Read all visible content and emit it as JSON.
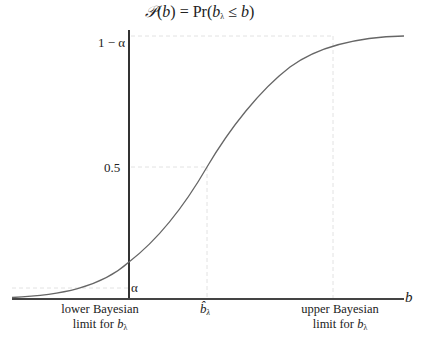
{
  "diagram": {
    "title_parts": {
      "func": "𝒫",
      "lhs_arg": "b",
      "eq": "=",
      "pr": "Pr",
      "var": "b",
      "var_sub": "λ",
      "rel": "≤",
      "rhs": "b"
    },
    "y_ticks": [
      {
        "label": "1 − α",
        "value": "1-alpha"
      },
      {
        "label": "0.5",
        "value": 0.5
      },
      {
        "label": "α",
        "value": "alpha"
      }
    ],
    "x_axis_label": "b",
    "x_markers": [
      {
        "line1": "lower Bayesian",
        "line2_prefix": "limit for ",
        "var": "b",
        "sub": "λ"
      },
      {
        "label": "b̂",
        "sub": "λ"
      },
      {
        "line1": "upper Bayesian",
        "line2_prefix": "limit for ",
        "var": "b",
        "sub": "λ"
      }
    ],
    "curve": "sigmoid CDF",
    "colors": {
      "axis": "#333333",
      "curve": "#666666",
      "guide": "#dddddd"
    }
  }
}
